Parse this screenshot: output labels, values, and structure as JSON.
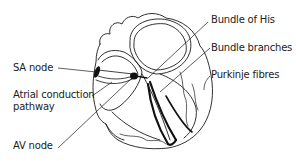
{
  "diagram": {
    "labels": {
      "sa_node": "SA node",
      "atrial_conduction_line1": "Atrial conduction",
      "atrial_conduction_line2": "pathway",
      "av_node": "AV node",
      "bundle_of_his": "Bundle of His",
      "bundle_branches": "Bundle branches",
      "purkinje_fibres": "Purkinje fibres"
    },
    "colors": {
      "line": "#1a1a1a",
      "background": "#ffffff"
    }
  }
}
